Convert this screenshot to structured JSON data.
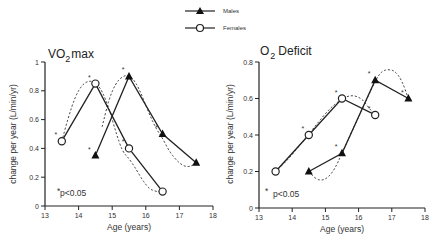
{
  "legend": {
    "position": "top-center",
    "entries": [
      {
        "name": "Males",
        "marker": "filled-triangle"
      },
      {
        "name": "Females",
        "marker": "open-circle"
      }
    ]
  },
  "chart_data": [
    {
      "type": "line",
      "title_main": "VO",
      "title_sub": "2",
      "title_rest": "max",
      "title": "VO2max",
      "xlabel": "Age (years)",
      "ylabel": "change per year (L/min/yr)",
      "xlim": [
        13,
        18
      ],
      "ylim": [
        0,
        1
      ],
      "xticks": [
        13,
        14,
        15,
        16,
        17,
        18
      ],
      "yticks": [
        0,
        0.2,
        0.4,
        0.6,
        0.8,
        1
      ],
      "ytick_labels": [
        "0",
        "0.2",
        "0.4",
        "0.6",
        "0.8",
        "1"
      ],
      "annotation": "p<0.05",
      "annotation_marker": "*",
      "series": [
        {
          "name": "Females",
          "marker": "open-circle",
          "x": [
            13.5,
            14.5,
            15.5,
            16.5
          ],
          "y": [
            0.45,
            0.85,
            0.4,
            0.1
          ],
          "significant": [
            true,
            true,
            true,
            false
          ],
          "fit_curve": [
            [
              13.5,
              0.45
            ],
            [
              13.7,
              0.62
            ],
            [
              13.9,
              0.76
            ],
            [
              14.1,
              0.84
            ],
            [
              14.3,
              0.87
            ],
            [
              14.5,
              0.86
            ],
            [
              14.7,
              0.8
            ],
            [
              14.9,
              0.68
            ],
            [
              15.1,
              0.52
            ],
            [
              15.3,
              0.38
            ],
            [
              15.5,
              0.33
            ],
            [
              15.7,
              0.26
            ],
            [
              15.9,
              0.18
            ],
            [
              16.1,
              0.12
            ],
            [
              16.3,
              0.1
            ],
            [
              16.5,
              0.1
            ]
          ]
        },
        {
          "name": "Males",
          "marker": "filled-triangle",
          "x": [
            14.5,
            15.5,
            16.5,
            17.5
          ],
          "y": [
            0.35,
            0.9,
            0.5,
            0.3
          ],
          "significant": [
            true,
            true,
            true,
            false
          ],
          "fit_curve": [
            [
              14.7,
              0.55
            ],
            [
              14.9,
              0.74
            ],
            [
              15.1,
              0.85
            ],
            [
              15.3,
              0.9
            ],
            [
              15.5,
              0.91
            ],
            [
              15.7,
              0.86
            ],
            [
              15.9,
              0.76
            ],
            [
              16.1,
              0.64
            ],
            [
              16.3,
              0.54
            ],
            [
              16.5,
              0.47
            ],
            [
              16.7,
              0.38
            ],
            [
              16.9,
              0.32
            ],
            [
              17.1,
              0.28
            ],
            [
              17.3,
              0.27
            ],
            [
              17.5,
              0.3
            ]
          ]
        }
      ]
    },
    {
      "type": "line",
      "title_main": "O",
      "title_sub": "2",
      "title_rest": "Deficit",
      "title": "O2 Deficit",
      "xlabel": "Age (years)",
      "ylabel": "change per year (L/min/yr)",
      "xlim": [
        13,
        18
      ],
      "ylim": [
        0,
        0.8
      ],
      "xticks": [
        13,
        14,
        15,
        16,
        17,
        18
      ],
      "yticks": [
        0,
        0.2,
        0.4,
        0.6,
        0.8
      ],
      "ytick_labels": [
        "0",
        "0.2",
        "0.4",
        "0.6",
        "0.8"
      ],
      "annotation": "p<0.05",
      "annotation_marker": "*",
      "series": [
        {
          "name": "Females",
          "marker": "open-circle",
          "x": [
            13.5,
            14.5,
            15.5,
            16.5
          ],
          "y": [
            0.2,
            0.4,
            0.6,
            0.51
          ],
          "significant": [
            false,
            true,
            true,
            true
          ],
          "fit_curve": [
            [
              13.5,
              0.2
            ],
            [
              13.9,
              0.27
            ],
            [
              14.3,
              0.36
            ],
            [
              14.7,
              0.45
            ],
            [
              15.1,
              0.54
            ],
            [
              15.5,
              0.6
            ],
            [
              15.8,
              0.62
            ],
            [
              16.1,
              0.6
            ],
            [
              16.3,
              0.55
            ],
            [
              16.5,
              0.51
            ]
          ]
        },
        {
          "name": "Males",
          "marker": "filled-triangle",
          "x": [
            14.5,
            15.5,
            16.5,
            17.5
          ],
          "y": [
            0.2,
            0.3,
            0.7,
            0.6
          ],
          "significant": [
            false,
            true,
            true,
            true
          ],
          "fit_curve": [
            [
              14.5,
              0.2
            ],
            [
              14.7,
              0.16
            ],
            [
              14.9,
              0.15
            ],
            [
              15.1,
              0.17
            ],
            [
              15.3,
              0.22
            ],
            [
              15.5,
              0.3
            ],
            [
              16.5,
              0.7
            ],
            [
              16.7,
              0.75
            ],
            [
              16.9,
              0.76
            ],
            [
              17.1,
              0.75
            ],
            [
              17.3,
              0.7
            ],
            [
              17.5,
              0.6
            ]
          ]
        }
      ]
    }
  ]
}
